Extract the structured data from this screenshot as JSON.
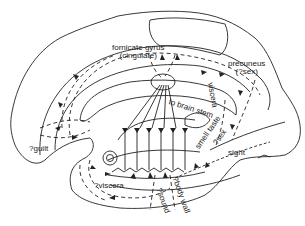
{
  "diagram": {
    "type": "brain medial sagittal section with limbic pathways",
    "line_color": "#222222",
    "background": "#ffffff",
    "labels": {
      "fornicate_line1": "fornicate gyrus",
      "fornicate_line2": "(cingulate)",
      "precuneus_line1": "precuneus",
      "precuneus_line2": "(?sex)",
      "brain_stem": "to brain stem",
      "viscera_rot": "viscera",
      "smell_taste": "smell taste",
      "sex_rot": "?sex",
      "sight": "sight",
      "guilt": "?guilt",
      "viscera": "?viscera",
      "sound": "?sound",
      "body_wall": "?body wall"
    }
  }
}
